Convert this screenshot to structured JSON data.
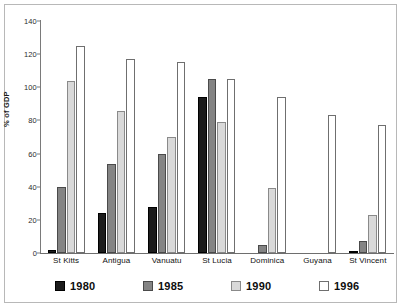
{
  "chart_data": {
    "type": "bar",
    "title": "",
    "xlabel": "",
    "ylabel": "% of GDP",
    "ylim": [
      0,
      140
    ],
    "ytick_step": 20,
    "yticks": [
      0,
      20,
      40,
      60,
      80,
      100,
      120,
      140
    ],
    "grid": false,
    "legend_position": "bottom",
    "categories": [
      "St Kitts",
      "Antigua",
      "Vanuatu",
      "St Lucia",
      "Dominica",
      "Guyana",
      "St Vincent"
    ],
    "series": [
      {
        "name": "1980",
        "color": "#1c1c1c",
        "values": [
          2,
          24,
          28,
          94,
          0,
          0,
          1
        ]
      },
      {
        "name": "1985",
        "color": "#848484",
        "values": [
          40,
          54,
          60,
          105,
          5,
          0,
          7
        ]
      },
      {
        "name": "1990",
        "color": "#d9d9d9",
        "values": [
          104,
          86,
          70,
          79,
          39,
          0,
          23
        ]
      },
      {
        "name": "1996",
        "color": "#ffffff",
        "values": [
          125,
          117,
          115,
          105,
          94,
          83,
          77
        ]
      }
    ]
  },
  "legend": {
    "items": [
      {
        "label": "1980"
      },
      {
        "label": "1985"
      },
      {
        "label": "1990"
      },
      {
        "label": "1996"
      }
    ]
  }
}
